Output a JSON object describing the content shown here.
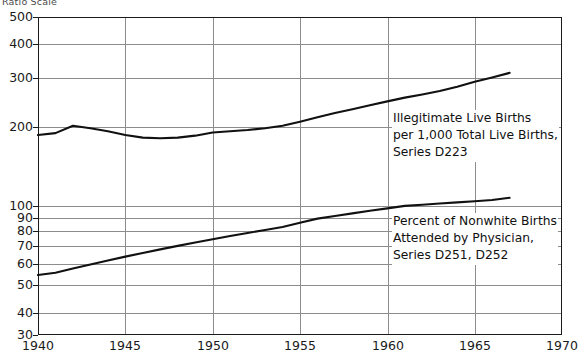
{
  "figure": {
    "scale_caption": "Ratio Scale",
    "background_color": "#ffffff",
    "line_color": "#111111",
    "grid_color": "#8d8d8d"
  },
  "y_axis": {
    "ticks": [
      {
        "label": "500",
        "value": 500,
        "y": 17
      },
      {
        "label": "400",
        "value": 400,
        "y": 44
      },
      {
        "label": "300",
        "value": 300,
        "y": 78
      },
      {
        "label": "200",
        "value": 200,
        "y": 127
      },
      {
        "label": "100",
        "value": 100,
        "y": 206
      },
      {
        "label": "90",
        "value": 90,
        "y": 218
      },
      {
        "label": "80",
        "value": 80,
        "y": 231
      },
      {
        "label": "70",
        "value": 70,
        "y": 246
      },
      {
        "label": "60",
        "value": 60,
        "y": 264
      },
      {
        "label": "50",
        "value": 50,
        "y": 285
      },
      {
        "label": "40",
        "value": 40,
        "y": 313
      },
      {
        "label": "30",
        "value": 30,
        "y": 335
      }
    ]
  },
  "x_axis": {
    "ticks": [
      {
        "label": "1940",
        "value": 1940,
        "x": 38
      },
      {
        "label": "1945",
        "value": 1945,
        "x": 125
      },
      {
        "label": "1950",
        "value": 1950,
        "x": 213
      },
      {
        "label": "1955",
        "value": 1955,
        "x": 300
      },
      {
        "label": "1960",
        "value": 1960,
        "x": 388
      },
      {
        "label": "1965",
        "value": 1965,
        "x": 475
      },
      {
        "label": "1970",
        "value": 1970,
        "x": 562
      }
    ]
  },
  "annotations": [
    {
      "id": "upper-series-label",
      "lines": [
        "Illegitimate Live Births",
        "per 1,000 Total Live Births,",
        "Series D223"
      ],
      "left": 392,
      "top": 110
    },
    {
      "id": "lower-series-label",
      "lines": [
        "Percent of Nonwhite Births",
        "Attended by Physician,",
        "Series D251, D252"
      ],
      "left": 392,
      "top": 213
    }
  ],
  "chart_data": {
    "type": "line",
    "title": "",
    "subtitle": "",
    "xlabel": "",
    "ylabel": "",
    "scale": "log",
    "grid": true,
    "legend_position": "inline-annotation",
    "xlim": [
      1940,
      1970
    ],
    "ylim": [
      30,
      500
    ],
    "x_ticks": [
      1940,
      1945,
      1950,
      1955,
      1960,
      1965,
      1970
    ],
    "y_ticks": [
      30,
      40,
      50,
      60,
      70,
      80,
      90,
      100,
      200,
      300,
      400,
      500
    ],
    "series": [
      {
        "name": "Illegitimate Live Births per 1,000 Total Live Births, Series D223",
        "units": "per 1,000 total live births",
        "x": [
          1940,
          1941,
          1942,
          1943,
          1944,
          1945,
          1946,
          1947,
          1948,
          1949,
          1950,
          1951,
          1952,
          1953,
          1954,
          1955,
          1956,
          1957,
          1958,
          1959,
          1960,
          1961,
          1962,
          1963,
          1964,
          1965,
          1966,
          1967
        ],
        "values": [
          176,
          179,
          191,
          187,
          182,
          176,
          172,
          171,
          172,
          175,
          180,
          182,
          184,
          187,
          191,
          198,
          206,
          214,
          221,
          229,
          237,
          245,
          252,
          260,
          270,
          282,
          293,
          305
        ]
      },
      {
        "name": "Percent of Nonwhite Births Attended by Physician, Series D251, D252",
        "units": "percent",
        "x": [
          1940,
          1941,
          1942,
          1943,
          1944,
          1945,
          1946,
          1947,
          1948,
          1949,
          1950,
          1951,
          1952,
          1953,
          1954,
          1955,
          1956,
          1957,
          1958,
          1959,
          1960,
          1961,
          1962,
          1963,
          1964,
          1965,
          1966,
          1967
        ],
        "values": [
          51,
          52,
          54,
          56,
          58,
          60,
          62,
          64,
          66,
          68,
          70,
          72,
          74,
          76,
          78,
          81,
          84,
          86,
          88,
          90,
          92,
          94,
          95,
          96,
          97,
          98,
          99,
          101
        ]
      }
    ]
  }
}
